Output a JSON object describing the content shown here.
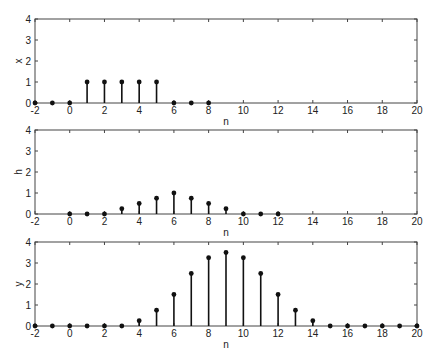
{
  "figure": {
    "layout": "3 stacked stem-plot subplots sharing x range",
    "colors": {
      "stem": "#111111",
      "axes": "#444444",
      "background": "#ffffff"
    }
  },
  "chart_data": [
    {
      "type": "stem",
      "title": "",
      "xlabel": "n",
      "ylabel": "x",
      "xlim": [
        -2,
        20
      ],
      "ylim": [
        0,
        4
      ],
      "xticks": [
        -2,
        0,
        2,
        4,
        6,
        8,
        10,
        12,
        14,
        16,
        18,
        20
      ],
      "yticks": [
        0,
        1,
        2,
        3,
        4
      ],
      "grid": false,
      "x": [
        -2,
        -1,
        0,
        1,
        2,
        3,
        4,
        5,
        6,
        7,
        8
      ],
      "values": [
        0,
        0,
        0,
        1,
        1,
        1,
        1,
        1,
        0,
        0,
        0
      ]
    },
    {
      "type": "stem",
      "title": "",
      "xlabel": "n",
      "ylabel": "h",
      "xlim": [
        -2,
        20
      ],
      "ylim": [
        0,
        4
      ],
      "xticks": [
        -2,
        0,
        2,
        4,
        6,
        8,
        10,
        12,
        14,
        16,
        18,
        20
      ],
      "yticks": [
        0,
        1,
        2,
        3,
        4
      ],
      "grid": false,
      "x": [
        0,
        1,
        2,
        3,
        4,
        5,
        6,
        7,
        8,
        9,
        10,
        11,
        12
      ],
      "values": [
        0,
        0,
        0,
        0.25,
        0.5,
        0.75,
        1,
        0.75,
        0.5,
        0.25,
        0,
        0,
        0
      ]
    },
    {
      "type": "stem",
      "title": "",
      "xlabel": "n",
      "ylabel": "y",
      "xlim": [
        -2,
        20
      ],
      "ylim": [
        0,
        4
      ],
      "xticks": [
        -2,
        0,
        2,
        4,
        6,
        8,
        10,
        12,
        14,
        16,
        18,
        20
      ],
      "yticks": [
        0,
        1,
        2,
        3,
        4
      ],
      "grid": false,
      "x": [
        -2,
        -1,
        0,
        1,
        2,
        3,
        4,
        5,
        6,
        7,
        8,
        9,
        10,
        11,
        12,
        13,
        14,
        15,
        16,
        17,
        18,
        19,
        20
      ],
      "values": [
        0,
        0,
        0,
        0,
        0,
        0,
        0.25,
        0.75,
        1.5,
        2.5,
        3.25,
        3.5,
        3.25,
        2.5,
        1.5,
        0.75,
        0.25,
        0,
        0,
        0,
        0,
        0,
        0
      ]
    }
  ]
}
